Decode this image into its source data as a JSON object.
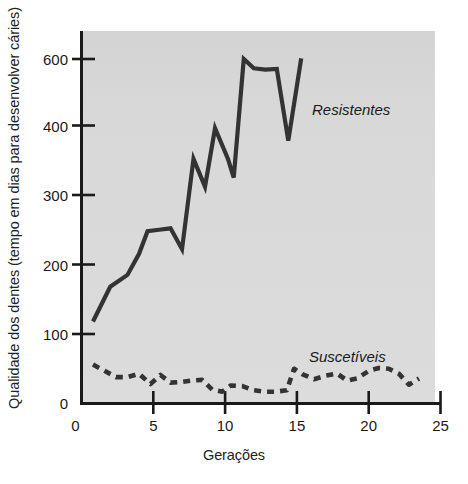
{
  "figure": {
    "background_color": "#ffffff",
    "plot_background_color": "#d9d9d9",
    "axis_color": "#1a1a1a",
    "line_color": "#333333"
  },
  "axes": {
    "xlabel": "Gerações",
    "ylabel": "Qualidade dos dentes (tempo em dias para desenvolver cáries)",
    "xticks": [
      "0",
      "5",
      "10",
      "15",
      "20",
      "25"
    ],
    "yticks": [
      "0",
      "100",
      "200",
      "300",
      "400",
      "600"
    ]
  },
  "series_labels": {
    "resistant": "Resistentes",
    "susceptible": "Suscetíveis"
  },
  "chart_data": {
    "type": "line",
    "title": "",
    "xlabel": "Gerações",
    "ylabel": "Qualidade dos dentes (tempo em dias para desenvolver cáries)",
    "xlim": [
      0,
      25
    ],
    "ylim": [
      0,
      620
    ],
    "xticks": [
      0,
      5,
      10,
      15,
      20,
      25
    ],
    "yticks": [
      0,
      100,
      200,
      300,
      400,
      600
    ],
    "grid": false,
    "legend": "inline-annotations",
    "series": [
      {
        "name": "Resistentes",
        "style": "solid",
        "color": "#333333",
        "x": [
          0.8,
          2.0,
          3.2,
          4.0,
          4.6,
          5.4,
          6.2,
          7.0,
          7.8,
          8.6,
          9.3,
          10.2,
          10.6,
          11.3,
          12.0,
          12.8,
          13.6,
          14.4,
          15.3
        ],
        "y": [
          118,
          168,
          185,
          215,
          248,
          250,
          252,
          222,
          352,
          312,
          396,
          352,
          325,
          600,
          572,
          568,
          570,
          378,
          602
        ]
      },
      {
        "name": "Suscetíveis",
        "style": "dashed",
        "color": "#333333",
        "x": [
          0.8,
          1.6,
          2.4,
          3.2,
          4.0,
          4.8,
          5.5,
          6.2,
          7.0,
          7.7,
          8.4,
          9.1,
          9.8,
          10.4,
          11.2,
          12.0,
          12.8,
          13.5,
          14.3,
          14.8,
          15.4,
          16.2,
          17.0,
          17.8,
          18.5,
          19.2,
          20.0,
          20.7,
          21.4,
          22.1,
          22.8,
          23.5
        ],
        "y": [
          56,
          47,
          38,
          38,
          43,
          28,
          41,
          30,
          31,
          33,
          34,
          20,
          17,
          26,
          25,
          19,
          17,
          17,
          19,
          50,
          42,
          35,
          40,
          43,
          33,
          36,
          47,
          51,
          50,
          43,
          27,
          36
        ]
      }
    ]
  }
}
